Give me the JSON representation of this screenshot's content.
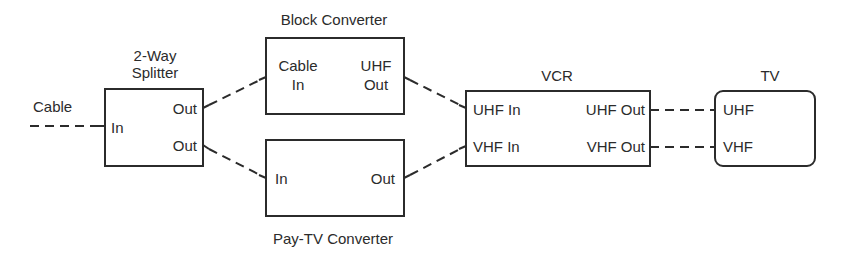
{
  "diagram": {
    "type": "signal-flow",
    "input": {
      "label": "Cable"
    },
    "nodes": [
      {
        "id": "splitter",
        "title_line1": "2-Way",
        "title_line2": "Splitter",
        "ports": {
          "in": "In",
          "out1": "Out",
          "out2": "Out"
        }
      },
      {
        "id": "block_converter",
        "title": "Block Converter",
        "ports": {
          "in_line1": "Cable",
          "in_line2": "In",
          "out_line1": "UHF",
          "out_line2": "Out"
        }
      },
      {
        "id": "paytv_converter",
        "title": "Pay-TV Converter",
        "ports": {
          "in": "In",
          "out": "Out"
        }
      },
      {
        "id": "vcr",
        "title": "VCR",
        "ports": {
          "uhf_in": "UHF In",
          "vhf_in": "VHF In",
          "uhf_out": "UHF Out",
          "vhf_out": "VHF Out"
        }
      },
      {
        "id": "tv",
        "title": "TV",
        "ports": {
          "uhf": "UHF",
          "vhf": "VHF"
        }
      }
    ],
    "edges": [
      {
        "from": "Cable",
        "to": "splitter.In"
      },
      {
        "from": "splitter.Out(top)",
        "to": "block_converter.Cable In"
      },
      {
        "from": "splitter.Out(bottom)",
        "to": "paytv_converter.In"
      },
      {
        "from": "block_converter.UHF Out",
        "to": "vcr.UHF In"
      },
      {
        "from": "paytv_converter.Out",
        "to": "vcr.VHF In"
      },
      {
        "from": "vcr.UHF Out",
        "to": "tv.UHF"
      },
      {
        "from": "vcr.VHF Out",
        "to": "tv.VHF"
      }
    ],
    "colors": {
      "stroke": "#2b2b2b",
      "background": "#ffffff"
    }
  }
}
